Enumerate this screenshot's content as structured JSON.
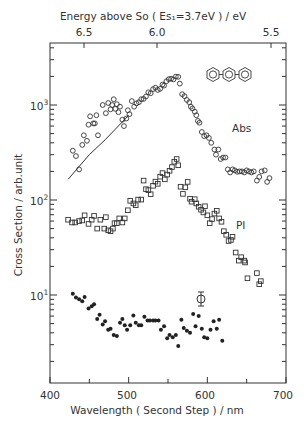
{
  "chart_data": {
    "type": "scatter",
    "title": "",
    "xlabel": "Wavelength (Second Step) / nm",
    "x2label": "Energy above So (Es1=3.7eV) / eV",
    "ylabel": "Cross Section / arb.unit",
    "xlim": [
      400,
      700
    ],
    "ylim_log10": [
      -0.4,
      3.2
    ],
    "yscale": "log",
    "xticks": [
      400,
      500,
      600,
      700
    ],
    "x2ticks": [
      {
        "label": "6.5",
        "x_nm": 445
      },
      {
        "label": "6.0",
        "x_nm": 508
      },
      {
        "label": "5.5",
        "x_nm": 603
      }
    ],
    "yticks": [
      {
        "label": "10",
        "exp": "3",
        "value": 1000
      },
      {
        "label": "10",
        "exp": "2",
        "value": 100
      },
      {
        "label": "10",
        "exp": "1",
        "value": 10
      }
    ],
    "annotations": [
      "Abs",
      "PI",
      "terphenyl-structure",
      "error-bar"
    ],
    "series": [
      {
        "name": "Abs",
        "marker": "circle",
        "points": [
          [
            429,
            330
          ],
          [
            433,
            290
          ],
          [
            437,
            210
          ],
          [
            441,
            380
          ],
          [
            443,
            480
          ],
          [
            447,
            420
          ],
          [
            449,
            620
          ],
          [
            451,
            760
          ],
          [
            455,
            640
          ],
          [
            457,
            640
          ],
          [
            459,
            780
          ],
          [
            461,
            480
          ],
          [
            467,
            1000
          ],
          [
            471,
            820
          ],
          [
            474,
            1050
          ],
          [
            477,
            900
          ],
          [
            479,
            1000
          ],
          [
            481,
            1150
          ],
          [
            483,
            910
          ],
          [
            485,
            1020
          ],
          [
            487,
            840
          ],
          [
            489,
            960
          ],
          [
            492,
            700
          ],
          [
            494,
            600
          ],
          [
            497,
            720
          ],
          [
            499,
            880
          ],
          [
            501,
            800
          ],
          [
            504,
            1100
          ],
          [
            507,
            960
          ],
          [
            510,
            1040
          ],
          [
            513,
            1070
          ],
          [
            516,
            1150
          ],
          [
            519,
            1160
          ],
          [
            522,
            1230
          ],
          [
            525,
            1360
          ],
          [
            528,
            1330
          ],
          [
            531,
            1470
          ],
          [
            534,
            1520
          ],
          [
            537,
            1440
          ],
          [
            540,
            1480
          ],
          [
            543,
            1640
          ],
          [
            545,
            1600
          ],
          [
            548,
            1780
          ],
          [
            551,
            1870
          ],
          [
            554,
            1890
          ],
          [
            557,
            1860
          ],
          [
            560,
            1990
          ],
          [
            563,
            1980
          ],
          [
            565,
            1680
          ],
          [
            568,
            1300
          ],
          [
            571,
            1240
          ],
          [
            574,
            1130
          ],
          [
            577,
            1070
          ],
          [
            579,
            960
          ],
          [
            581,
            920
          ],
          [
            584,
            850
          ],
          [
            586,
            780
          ],
          [
            588,
            680
          ],
          [
            590,
            650
          ],
          [
            593,
            520
          ],
          [
            596,
            470
          ],
          [
            599,
            480
          ],
          [
            602,
            450
          ],
          [
            605,
            400
          ],
          [
            609,
            340
          ],
          [
            611,
            300
          ],
          [
            614,
            340
          ],
          [
            617,
            270
          ],
          [
            620,
            280
          ],
          [
            623,
            280
          ],
          [
            626,
            210
          ],
          [
            629,
            195
          ],
          [
            632,
            210
          ],
          [
            635,
            205
          ],
          [
            638,
            198
          ],
          [
            641,
            200
          ],
          [
            644,
            200
          ],
          [
            647,
            195
          ],
          [
            650,
            205
          ],
          [
            653,
            200
          ],
          [
            656,
            195
          ],
          [
            659,
            200
          ],
          [
            663,
            160
          ],
          [
            666,
            175
          ],
          [
            669,
            200
          ],
          [
            673,
            205
          ],
          [
            676,
            155
          ],
          [
            679,
            170
          ]
        ]
      },
      {
        "name": "Abs fit",
        "style": "line",
        "points": [
          [
            423,
            165
          ],
          [
            450,
            300
          ],
          [
            470,
            430
          ],
          [
            500,
            780
          ]
        ]
      },
      {
        "name": "PI",
        "marker": "square",
        "points": [
          [
            423,
            62
          ],
          [
            428,
            58
          ],
          [
            432,
            58
          ],
          [
            437,
            60
          ],
          [
            441,
            61
          ],
          [
            444,
            69
          ],
          [
            449,
            56
          ],
          [
            453,
            62
          ],
          [
            456,
            68
          ],
          [
            460,
            50
          ],
          [
            464,
            62
          ],
          [
            469,
            50
          ],
          [
            471,
            66
          ],
          [
            474,
            48
          ],
          [
            477,
            47
          ],
          [
            480,
            50
          ],
          [
            482,
            57
          ],
          [
            485,
            57
          ],
          [
            488,
            64
          ],
          [
            492,
            58
          ],
          [
            495,
            64
          ],
          [
            499,
            78
          ],
          [
            502,
            98
          ],
          [
            506,
            92
          ],
          [
            509,
            88
          ],
          [
            512,
            101
          ],
          [
            516,
            101
          ],
          [
            519,
            160
          ],
          [
            522,
            130
          ],
          [
            525,
            127
          ],
          [
            528,
            115
          ],
          [
            531,
            141
          ],
          [
            534,
            156
          ],
          [
            537,
            148
          ],
          [
            540,
            176
          ],
          [
            543,
            192
          ],
          [
            546,
            165
          ],
          [
            549,
            185
          ],
          [
            552,
            203
          ],
          [
            555,
            222
          ],
          [
            558,
            253
          ],
          [
            561,
            270
          ],
          [
            563,
            232
          ],
          [
            566,
            138
          ],
          [
            569,
            116
          ],
          [
            572,
            136
          ],
          [
            575,
            155
          ],
          [
            578,
            103
          ],
          [
            580,
            96
          ],
          [
            584,
            102
          ],
          [
            586,
            92
          ],
          [
            589,
            85
          ],
          [
            592,
            79
          ],
          [
            595,
            74
          ],
          [
            597,
            86
          ],
          [
            600,
            69
          ],
          [
            603,
            57
          ],
          [
            606,
            63
          ],
          [
            609,
            72
          ],
          [
            612,
            77
          ],
          [
            615,
            64
          ],
          [
            618,
            59
          ],
          [
            621,
            47
          ],
          [
            624,
            43
          ],
          [
            627,
            37
          ],
          [
            630,
            38
          ],
          [
            632,
            41
          ],
          [
            636,
            28
          ],
          [
            640,
            23
          ],
          [
            643,
            25
          ],
          [
            647,
            23
          ],
          [
            648,
            22
          ],
          [
            651,
            15
          ],
          [
            663,
            17
          ],
          [
            666,
            13
          ],
          [
            668,
            14
          ]
        ]
      },
      {
        "name": "PI-low",
        "marker": "filled-circle",
        "points": [
          [
            429,
            10.3
          ],
          [
            433,
            9.4
          ],
          [
            437,
            9.0
          ],
          [
            441,
            8.6
          ],
          [
            444,
            9.5
          ],
          [
            449,
            7.2
          ],
          [
            453,
            7.6
          ],
          [
            456,
            8.0
          ],
          [
            460,
            5.6
          ],
          [
            463,
            6.2
          ],
          [
            467,
            4.9
          ],
          [
            470,
            5.3
          ],
          [
            474,
            4.3
          ],
          [
            477,
            4.4
          ],
          [
            481,
            3.8
          ],
          [
            485,
            3.7
          ],
          [
            489,
            5.1
          ],
          [
            492,
            5.6
          ],
          [
            495,
            4.8
          ],
          [
            498,
            4.3
          ],
          [
            502,
            4.8
          ],
          [
            506,
            6.1
          ],
          [
            509,
            5.1
          ],
          [
            513,
            4.8
          ],
          [
            516,
            4.8
          ],
          [
            520,
            5.9
          ],
          [
            524,
            5.4
          ],
          [
            527,
            5.4
          ],
          [
            531,
            5.4
          ],
          [
            534,
            5.4
          ],
          [
            538,
            5.4
          ],
          [
            541,
            4.3
          ],
          [
            545,
            4.7
          ],
          [
            549,
            3.5
          ],
          [
            552,
            3.8
          ],
          [
            556,
            3.6
          ],
          [
            560,
            3.8
          ],
          [
            563,
            2.9
          ],
          [
            567,
            5.5
          ],
          [
            570,
            4.5
          ],
          [
            574,
            4.2
          ],
          [
            578,
            4.0
          ],
          [
            582,
            6.3
          ],
          [
            585,
            4.7
          ],
          [
            589,
            6.0
          ],
          [
            593,
            4.4
          ],
          [
            596,
            3.6
          ],
          [
            600,
            3.5
          ],
          [
            604,
            4.3
          ],
          [
            608,
            5.3
          ],
          [
            612,
            4.4
          ],
          [
            615,
            5.5
          ],
          [
            619,
            3.3
          ]
        ]
      }
    ]
  },
  "labels": {
    "top_axis_title": "Energy above So ( Es₁=3.7eV ) / eV",
    "bottom_axis_title": "Wavelength ( Second Step )  / nm",
    "y_axis_title": "Cross Section  /  arb.unit",
    "abs": "Abs",
    "pi": "PI",
    "xtick_400": "400",
    "xtick_500": "500",
    "xtick_600": "600",
    "xtick_700": "700",
    "x2tick_65": "6.5",
    "x2tick_60": "6.0",
    "x2tick_55": "5.5",
    "ytick_base": "10",
    "ytick_3": "3",
    "ytick_2": "2",
    "ytick_1": "1"
  }
}
